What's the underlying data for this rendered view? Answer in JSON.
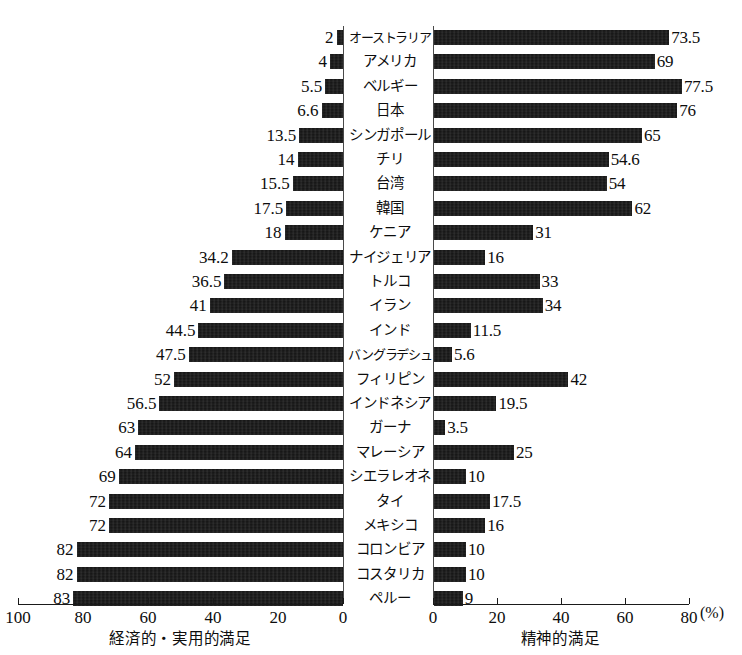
{
  "chart_data": {
    "type": "bar",
    "orientation": "horizontal",
    "layout": "diverging-bidirectional",
    "title": "",
    "categories": [
      "オーストラリア",
      "アメリカ",
      "ベルギー",
      "日本",
      "シンガポール",
      "チリ",
      "台湾",
      "韓国",
      "ケニア",
      "ナイジェリア",
      "トルコ",
      "イラン",
      "インド",
      "バングラデシュ",
      "フィリピン",
      "インドネシア",
      "ガーナ",
      "マレーシア",
      "シエラレオネ",
      "タイ",
      "メキシコ",
      "コロンビア",
      "コスタリカ",
      "ペルー"
    ],
    "series": [
      {
        "name": "経済的・実用的満足",
        "side": "left",
        "values": [
          2,
          4,
          5.5,
          6.6,
          13.5,
          14,
          15.5,
          17.5,
          18,
          34.2,
          36.5,
          41,
          44.5,
          47.5,
          52,
          56.5,
          63,
          64,
          69,
          72,
          72,
          82,
          82,
          83
        ],
        "labels": [
          "2",
          "4",
          "5.5",
          "6.6",
          "13.5",
          "14",
          "15.5",
          "17.5",
          "18",
          "34.2",
          "36.5",
          "41",
          "44.5",
          "47.5",
          "52",
          "56.5",
          "63",
          "64",
          "69",
          "72",
          "72",
          "82",
          "82",
          "83"
        ],
        "axis_ticks": [
          100,
          80,
          60,
          40,
          20,
          0
        ],
        "axis_tick_labels": [
          "100",
          "80",
          "60",
          "40",
          "20",
          "0"
        ],
        "axis_max": 100,
        "axis_min": 0,
        "axis_direction": "right-to-left"
      },
      {
        "name": "精神的満足",
        "side": "right",
        "values": [
          73.5,
          69,
          77.5,
          76,
          65,
          54.6,
          54,
          62,
          31,
          16,
          33,
          34,
          11.5,
          5.6,
          42,
          19.5,
          3.5,
          25,
          10,
          17.5,
          16,
          10,
          10,
          9
        ],
        "labels": [
          "73.5",
          "69",
          "77.5",
          "76",
          "65",
          "54.6",
          "54",
          "62",
          "31",
          "16",
          "33",
          "34",
          "11.5",
          "5.6",
          "42",
          "19.5",
          "3.5",
          "25",
          "10",
          "17.5",
          "16",
          "10",
          "10",
          "9"
        ],
        "axis_ticks": [
          0,
          20,
          40,
          60,
          80
        ],
        "axis_tick_labels": [
          "0",
          "20",
          "40",
          "60",
          "80"
        ],
        "axis_max": 88,
        "axis_min": 0,
        "axis_direction": "left-to-right"
      }
    ],
    "unit_label": "(%)",
    "grid": false,
    "legend": "none",
    "bar_color": "#111111"
  },
  "axes": {
    "left_caption": "経済的・実用的満足",
    "right_caption": "精神的満足",
    "unit": "(%)",
    "left_ticks": [
      "100",
      "80",
      "60",
      "40",
      "20",
      "0"
    ],
    "right_ticks": [
      "0",
      "20",
      "40",
      "60",
      "80"
    ]
  }
}
